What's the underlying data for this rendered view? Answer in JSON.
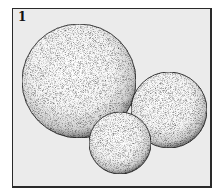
{
  "figure": {
    "label": "1",
    "panel_background": "#ebebeb",
    "border_color": "#2a2a2a"
  },
  "spheres": [
    {
      "name": "large-sphere",
      "cx": 79,
      "cy": 81,
      "r": 57
    },
    {
      "name": "right-sphere",
      "cx": 169,
      "cy": 110,
      "r": 38
    },
    {
      "name": "small-sphere",
      "cx": 120,
      "cy": 143,
      "r": 31
    }
  ]
}
